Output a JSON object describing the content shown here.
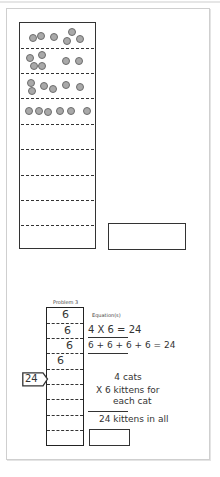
{
  "worksheet": {
    "model_1": {
      "dot_color": "#a9a9a9",
      "rows": [
        {
          "index": 1,
          "dot_count": 6,
          "dots": [
            [
              33,
              38
            ],
            [
              41,
              36
            ],
            [
              54,
              37
            ],
            [
              72,
              32
            ],
            [
              67,
              41
            ],
            [
              80,
              39
            ]
          ]
        },
        {
          "index": 2,
          "dot_count": 6,
          "dots": [
            [
              30,
              58
            ],
            [
              42,
              55
            ],
            [
              34,
              66
            ],
            [
              42,
              66
            ],
            [
              66,
              61
            ],
            [
              79,
              61
            ]
          ]
        },
        {
          "index": 3,
          "dot_count": 6,
          "dots": [
            [
              31,
              83
            ],
            [
              32,
              91
            ],
            [
              44,
              86
            ],
            [
              53,
              89
            ],
            [
              66,
              85
            ],
            [
              80,
              87
            ]
          ]
        },
        {
          "index": 4,
          "dot_count": 6,
          "dots": [
            [
              29,
              111
            ],
            [
              39,
              111
            ],
            [
              48,
              112
            ],
            [
              60,
              111
            ],
            [
              71,
              111
            ],
            [
              87,
              111
            ]
          ]
        },
        {
          "index": 5,
          "dot_count": 0,
          "dots": []
        },
        {
          "index": 6,
          "dot_count": 0,
          "dots": []
        },
        {
          "index": 7,
          "dot_count": 0,
          "dots": []
        },
        {
          "index": 8,
          "dot_count": 0,
          "dots": []
        },
        {
          "index": 9,
          "dot_count": 0,
          "dots": []
        }
      ],
      "answer_value": ""
    },
    "problem_3": {
      "title": "Problem 3",
      "equations_label": "Equation(s)",
      "cells": [
        "6",
        "6",
        "6",
        "6",
        "",
        "",
        "",
        "",
        ""
      ],
      "total_tag": "24",
      "equations": [
        "4 X 6 = 24",
        "6 + 6 + 6 + 6 = 24"
      ],
      "word_problem": {
        "line_1": "4 cats",
        "line_2": "X 6 kittens for",
        "line_3": "each cat",
        "result": "24 kittens in all"
      },
      "answer_value": ""
    }
  }
}
